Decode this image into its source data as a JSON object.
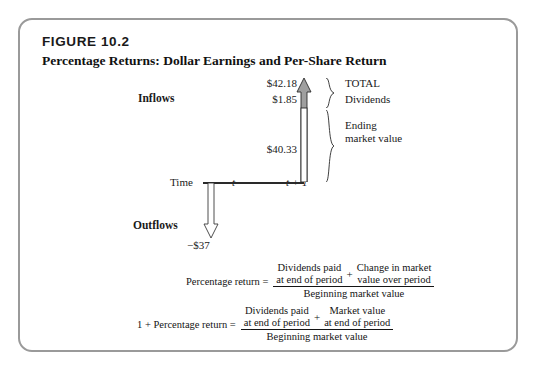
{
  "figure": {
    "number": "FIGURE 10.2",
    "title": "Percentage Returns: Dollar Earnings and Per-Share Return"
  },
  "diagram": {
    "inflows_label": "Inflows",
    "outflows_label": "Outflows",
    "time_label": "Time",
    "time_start": "t",
    "time_end": "t + 1",
    "total_value": "$42.18",
    "dividends_value": "$1.85",
    "ending_market_value": "$40.33",
    "outflow_value": "−$37",
    "brace_total_label": "TOTAL",
    "brace_dividends_label": "Dividends",
    "brace_ending_label": "Ending market value"
  },
  "formulas": [
    {
      "lhs": "Percentage return =",
      "numerator_left_line1": "Dividends paid",
      "numerator_left_line2": "at end of period",
      "operator": "+",
      "numerator_right_line1": "Change in market",
      "numerator_right_line2": "value over period",
      "denominator": "Beginning market value"
    },
    {
      "lhs": "1 + Percentage return =",
      "numerator_left_line1": "Dividends paid",
      "numerator_left_line2": "at end of period",
      "operator": "+",
      "numerator_right_line1": "Market value",
      "numerator_right_line2": "at end of period",
      "denominator": "Beginning market value"
    }
  ],
  "colors": {
    "frame_border": "#9a9a9a",
    "arrow_fill_gray": "#9f9f9f",
    "arrow_outline": "#2a2a2a",
    "text": "#1a1a1a"
  }
}
